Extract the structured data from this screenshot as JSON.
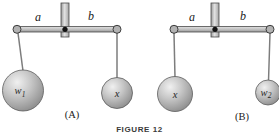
{
  "figure": {
    "caption": "FIGURE 12",
    "diagram_a": {
      "arm_left_label": "a",
      "arm_right_label": "b",
      "left_sphere_label": "w",
      "left_sphere_sub": "1",
      "right_sphere_label": "x",
      "right_sphere_sub": "",
      "caption": "(A)"
    },
    "diagram_b": {
      "arm_left_label": "a",
      "arm_right_label": "b",
      "left_sphere_label": "x",
      "left_sphere_sub": "",
      "right_sphere_label": "w",
      "right_sphere_sub": "2",
      "caption": "(B)"
    },
    "colors": {
      "background": "#ffffff",
      "metal_light": "#e2e2e2",
      "metal_mid": "#bdbdbd",
      "metal_dark": "#9a9a9a",
      "outline": "#4a4a4a",
      "pivot": "#111111",
      "wire": "#7d7d7d",
      "sphere_highlight": "#f0f0f0",
      "sphere_shadow": "#8c8c8c",
      "text": "#1a1a1a"
    }
  }
}
